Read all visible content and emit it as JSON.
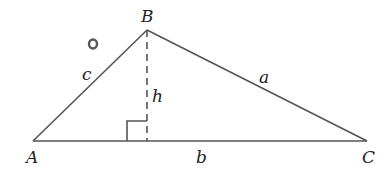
{
  "diagram": {
    "type": "triangle-with-altitude",
    "vertices": {
      "A": {
        "label": "A",
        "x": 33,
        "y": 141
      },
      "B": {
        "label": "B",
        "x": 147,
        "y": 30
      },
      "C": {
        "label": "C",
        "x": 367,
        "y": 141
      }
    },
    "sides": {
      "a": {
        "label": "a"
      },
      "b": {
        "label": "b"
      },
      "c": {
        "label": "c"
      }
    },
    "altitude": {
      "label": "h",
      "style": "dashed"
    },
    "right_angle_marker": true,
    "stray_mark": "o",
    "colors": {
      "line": "#555555",
      "text": "#222222"
    }
  }
}
